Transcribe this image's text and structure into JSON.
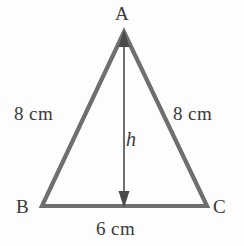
{
  "figure": {
    "type": "isosceles-triangle-with-altitude",
    "background_color": "#fdfdfd",
    "stroke_color": "#6f6f6f",
    "text_color": "#3a3a3a",
    "vertices": {
      "apex_label": "A",
      "bottom_left_label": "B",
      "bottom_right_label": "C"
    },
    "measurements": {
      "left_side": "8 cm",
      "right_side": "8 cm",
      "base": "6 cm",
      "height": "h"
    },
    "geometry": {
      "apex": {
        "x": 124,
        "y": 32
      },
      "bottom_left": {
        "x": 42,
        "y": 206
      },
      "bottom_right": {
        "x": 207,
        "y": 206
      },
      "altitude_x": 124,
      "altitude_top_y": 32,
      "altitude_bottom_y": 206
    }
  }
}
